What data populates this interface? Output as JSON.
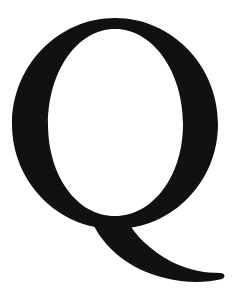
{
  "glyph": {
    "character": "Q",
    "style": "serif",
    "color": "#111111"
  },
  "background": {
    "color": "#ffffff"
  }
}
